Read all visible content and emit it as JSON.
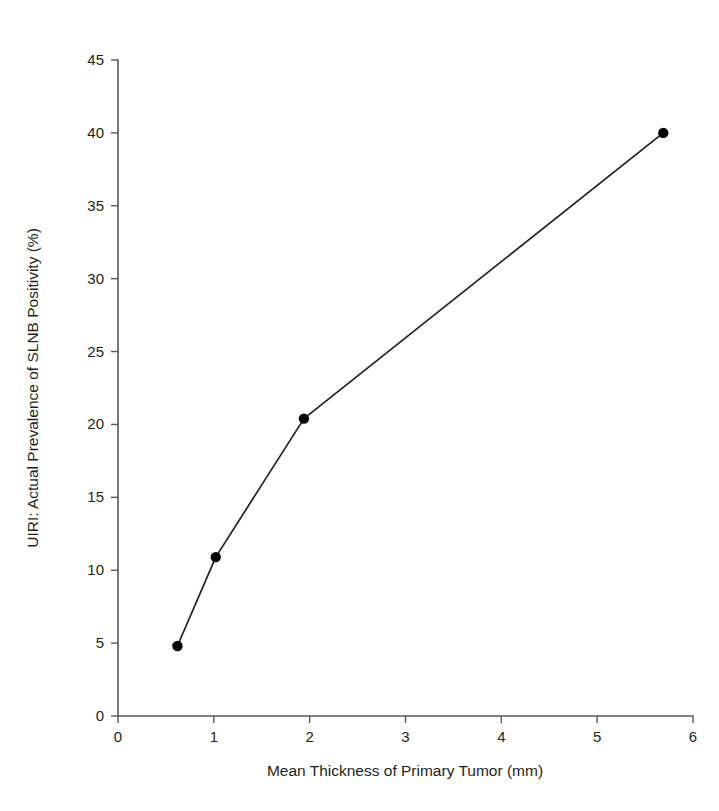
{
  "chart_data": {
    "type": "line",
    "title": "",
    "xlabel": "Mean Thickness of Primary Tumor (mm)",
    "ylabel": "UIRI: Actual Prevalence of SLNB Positivity (%)",
    "xlim": [
      0,
      6
    ],
    "ylim": [
      0,
      45
    ],
    "xticks": [
      0,
      1,
      2,
      3,
      4,
      5,
      6
    ],
    "yticks": [
      0,
      5,
      10,
      15,
      20,
      25,
      30,
      35,
      40,
      45
    ],
    "xtick_labels": [
      "0",
      "1",
      "2",
      "3",
      "4",
      "5",
      "6"
    ],
    "ytick_labels": [
      "0",
      "5",
      "10",
      "15",
      "20",
      "25",
      "30",
      "35",
      "40",
      "45"
    ],
    "grid": false,
    "legend": false,
    "legend_position": "none",
    "marker": "filled-circle",
    "line_color": "#231f20",
    "marker_color": "#000000",
    "axis_color": "#58595b",
    "background_color": "#ffffff",
    "series": [
      {
        "name": "UIRI: Actual Prevalence of SLNB Positivity",
        "x": [
          0.62,
          1.02,
          1.94,
          5.69
        ],
        "values": [
          4.8,
          10.9,
          20.4,
          40.0
        ],
        "points": [
          {
            "x": 0.62,
            "y": 4.8
          },
          {
            "x": 1.02,
            "y": 10.9
          },
          {
            "x": 1.94,
            "y": 20.4
          },
          {
            "x": 5.69,
            "y": 40.0
          }
        ]
      }
    ]
  },
  "figure": {
    "xlabel": "Mean Thickness of Primary Tumor (mm)",
    "ylabel": "UIRI: Actual Prevalence of SLNB Positivity (%)"
  }
}
